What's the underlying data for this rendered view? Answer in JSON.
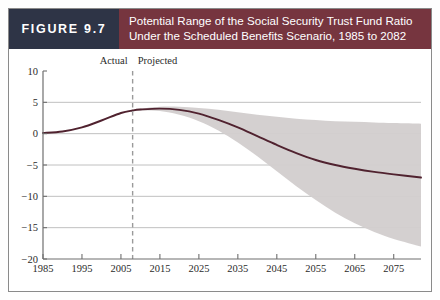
{
  "figure": {
    "number_label": "FIGURE 9.7",
    "title_line1": "Potential Range of the Social Security Trust Fund Ratio",
    "title_line2": "Under the Scheduled Benefits Scenario, 1985 to 2082"
  },
  "colors": {
    "navy": "#2e3446",
    "maroon": "#76353f",
    "line": "#50222f",
    "band": "#d2cdcd",
    "grid": "#b9b9b9",
    "axis": "#6f6f6f",
    "divider": "#9a9a9a"
  },
  "annotations": {
    "actual_label": "Actual",
    "projected_label": "Projected",
    "divider_year": 2008
  },
  "chart_data": {
    "type": "area",
    "title": "Potential Range of the Social Security Trust Fund Ratio Under the Scheduled Benefits Scenario, 1985 to 2082",
    "xlabel": "",
    "ylabel": "",
    "xlim": [
      1985,
      2082
    ],
    "ylim": [
      -20,
      10
    ],
    "grid": true,
    "legend_position": "none",
    "yticks": [
      10,
      5,
      0,
      -5,
      -10,
      -15,
      -20
    ],
    "ytick_labels": [
      "10",
      "5",
      "0",
      "−5",
      "−10",
      "−15",
      "−20"
    ],
    "xticks": [
      1985,
      1995,
      2005,
      2015,
      2025,
      2035,
      2045,
      2055,
      2065,
      2075
    ],
    "xtick_labels": [
      "1985",
      "1995",
      "2005",
      "2015",
      "2025",
      "2035",
      "2045",
      "2055",
      "2065",
      "2075"
    ],
    "x": [
      1985,
      1990,
      1995,
      2000,
      2005,
      2008,
      2010,
      2015,
      2020,
      2025,
      2030,
      2035,
      2040,
      2045,
      2050,
      2055,
      2060,
      2065,
      2070,
      2075,
      2082
    ],
    "series": [
      {
        "name": "Median projection",
        "values": [
          0.1,
          0.35,
          1.0,
          2.1,
          3.3,
          3.7,
          3.85,
          4.0,
          3.8,
          3.2,
          2.2,
          1.0,
          -0.4,
          -1.8,
          -3.1,
          -4.2,
          -5.0,
          -5.6,
          -6.1,
          -6.5,
          -7.0
        ]
      },
      {
        "name": "Upper bound (90th percentile)",
        "values": [
          0.1,
          0.35,
          1.0,
          2.1,
          3.35,
          3.8,
          4.0,
          4.3,
          4.3,
          4.1,
          3.8,
          3.4,
          3.0,
          2.7,
          2.4,
          2.2,
          2.0,
          1.9,
          1.8,
          1.7,
          1.6
        ]
      },
      {
        "name": "Lower bound (10th percentile)",
        "values": [
          0.1,
          0.35,
          1.0,
          2.05,
          3.25,
          3.6,
          3.7,
          3.6,
          3.0,
          2.0,
          0.5,
          -1.4,
          -3.6,
          -6.0,
          -8.4,
          -10.6,
          -12.6,
          -14.3,
          -15.7,
          -16.8,
          -18.0
        ]
      }
    ]
  }
}
